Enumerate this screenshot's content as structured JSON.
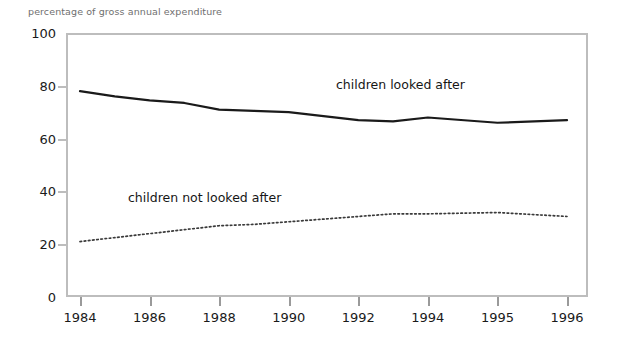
{
  "chart_data": {
    "type": "line",
    "title": "",
    "ylabel": "percentage of gross annual expenditure",
    "xlabel": "",
    "ylim": [
      0,
      100
    ],
    "yticks": [
      0,
      20,
      40,
      60,
      80,
      100
    ],
    "grid": false,
    "legend_position": "inline-annotation",
    "categories": [
      "1984",
      "1985",
      "1986",
      "1987",
      "1988",
      "1989",
      "1990",
      "1991",
      "1992",
      "1993",
      "1994",
      "1995",
      "1996"
    ],
    "xtick_labels": [
      "1984",
      "1986",
      "1988",
      "1990",
      "1992",
      "1994",
      "1995",
      "1996"
    ],
    "series": [
      {
        "name": "children looked after",
        "style": "solid",
        "color": "#1a1a1a",
        "values": [
          78.0,
          76.0,
          74.5,
          73.5,
          71.0,
          70.5,
          70.0,
          68.5,
          67.0,
          66.5,
          68.0,
          66.0,
          67.0
        ]
      },
      {
        "name": "children not looked after",
        "style": "dotted",
        "color": "#3a3a3a",
        "values": [
          21.0,
          22.5,
          24.0,
          25.5,
          27.0,
          27.5,
          28.5,
          29.5,
          30.5,
          31.5,
          31.5,
          32.0,
          30.5
        ]
      }
    ],
    "annotations": [
      {
        "text": "children looked after",
        "x": 1991.0,
        "y": 76.0
      },
      {
        "text": "children not looked after",
        "x": 1985.5,
        "y": 33.5
      }
    ]
  }
}
